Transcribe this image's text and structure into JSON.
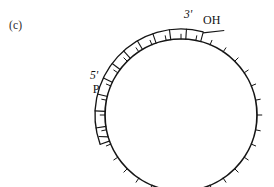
{
  "figure": {
    "panel_label": "(c)",
    "background_color": "#ffffff",
    "stroke_color": "#151515",
    "width": 274,
    "height": 187
  },
  "labels": {
    "three_prime": "3'",
    "three_prime_group": "OH",
    "five_prime": "5'",
    "five_prime_group": "P"
  },
  "chart_data": {
    "type": "diagram",
    "title": "(c)",
    "circle": {
      "center_x": 181,
      "center_y": 115,
      "radius": 76,
      "stroke_width": 1.7
    },
    "ticks": {
      "count": 32,
      "length": 5.2,
      "direction": "outward",
      "start_angle_deg": 0,
      "step_deg": 11.25
    },
    "duplex": {
      "inner_radius": 76,
      "outer_radius": 86,
      "start_angle_deg": 200,
      "end_angle_deg": 75,
      "rungs": 11,
      "sweep": "counterclockwise-from-200-to-75"
    },
    "annotations": [
      {
        "name": "three-prime-oh",
        "text_primary": "3'",
        "text_secondary": "OH",
        "x": 186,
        "y": 16,
        "angle_deg": 75
      },
      {
        "name": "five-prime-p",
        "text_primary": "5'",
        "text_secondary": "P",
        "x": 95,
        "y": 78,
        "angle_deg": 200
      }
    ]
  }
}
